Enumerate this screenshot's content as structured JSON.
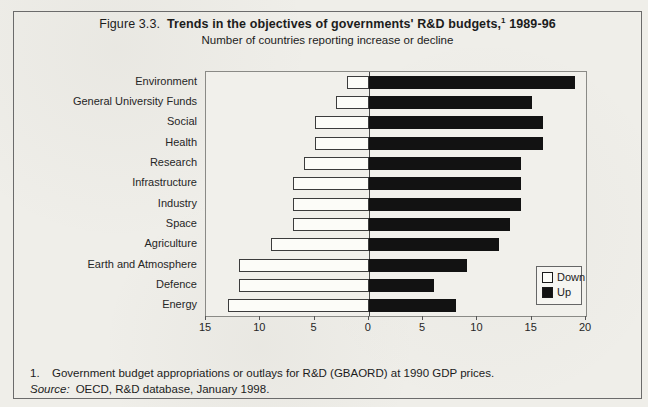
{
  "figure": {
    "label": "Figure 3.3.",
    "title_main": "Trends in the objectives of governments' R&D budgets,",
    "title_footnote_marker": "1",
    "title_suffix": "1989-96",
    "subtitle": "Number of countries reporting increase or decline"
  },
  "chart_data": {
    "type": "bar",
    "orientation": "horizontal-diverging",
    "subtitle": "Number of countries reporting increase or decline",
    "categories": [
      "Environment",
      "General University Funds",
      "Social",
      "Health",
      "Research",
      "Infrastructure",
      "Industry",
      "Space",
      "Agriculture",
      "Earth and Atmosphere",
      "Defence",
      "Energy"
    ],
    "series": [
      {
        "name": "Down",
        "direction": "left",
        "color": "#fcfcf8",
        "values": [
          2,
          3,
          5,
          5,
          6,
          7,
          7,
          7,
          9,
          12,
          12,
          13
        ]
      },
      {
        "name": "Up",
        "direction": "right",
        "color": "#121212",
        "values": [
          19,
          15,
          16,
          16,
          14,
          14,
          14,
          13,
          12,
          9,
          6,
          8
        ]
      }
    ],
    "xlim_left": 15,
    "xlim_right": 20,
    "x_tick_interval": 5,
    "x_tick_labels": [
      "15",
      "10",
      "5",
      "0",
      "5",
      "10",
      "15",
      "20"
    ],
    "grid": "off",
    "legend_position": "inside-right"
  },
  "footnotes": {
    "note1_number": "1.",
    "note1_text": "Government budget appropriations or outlays for R&D (GBAORD) at 1990 GDP prices.",
    "source_label": "Source:",
    "source_text": "OECD, R&D database, January 1998."
  },
  "colors": {
    "paper": "#efeee9",
    "bar_up": "#121212",
    "bar_down_fill": "#fcfcf8",
    "bar_down_border": "#3c3c3c",
    "figure_border": "#6b6b6b",
    "text": "#1c1c1c"
  }
}
